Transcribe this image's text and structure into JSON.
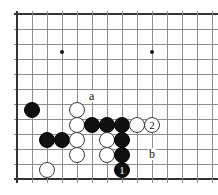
{
  "diagram": {
    "type": "go-board-problem",
    "board": {
      "origin_x": 17,
      "origin_y": 14,
      "spacing": 15,
      "cols": 13,
      "rows": 12,
      "line_color": "#8d8d8d",
      "edge_color": "#333333",
      "background": "#ffffff",
      "left_edge_col": 0,
      "top_edge_row": 0,
      "bottom_edge_row": 11
    },
    "star_points": [
      {
        "col": 3,
        "row": 2.5
      },
      {
        "col": 9,
        "row": 2.5
      },
      {
        "col": 9,
        "row": 7.5
      }
    ],
    "stones": [
      {
        "color": "black",
        "col": 1,
        "row": 6.4
      },
      {
        "color": "white",
        "col": 4,
        "row": 6.4
      },
      {
        "color": "white",
        "col": 4,
        "row": 7.4
      },
      {
        "color": "black",
        "col": 5,
        "row": 7.4
      },
      {
        "color": "black",
        "col": 6,
        "row": 7.4
      },
      {
        "color": "black",
        "col": 7,
        "row": 7.4
      },
      {
        "color": "white",
        "col": 8,
        "row": 7.4
      },
      {
        "color": "black",
        "col": 2,
        "row": 8.4
      },
      {
        "color": "black",
        "col": 3,
        "row": 8.4
      },
      {
        "color": "white",
        "col": 4,
        "row": 8.4
      },
      {
        "color": "white",
        "col": 6,
        "row": 8.4
      },
      {
        "color": "black",
        "col": 7,
        "row": 8.4
      },
      {
        "color": "white",
        "col": 4,
        "row": 9.4
      },
      {
        "color": "white",
        "col": 6,
        "row": 9.4
      },
      {
        "color": "black",
        "col": 7,
        "row": 9.4
      },
      {
        "color": "white",
        "col": 2,
        "row": 10.4
      }
    ],
    "move_markers": [
      {
        "label": "1",
        "color": "black",
        "col": 7,
        "row": 10.4
      },
      {
        "label": "2",
        "color": "white",
        "col": 9,
        "row": 7.4
      }
    ],
    "point_labels": [
      {
        "label": "a",
        "col": 5,
        "row": 5.5
      },
      {
        "label": "b",
        "col": 9,
        "row": 9.4
      }
    ]
  }
}
